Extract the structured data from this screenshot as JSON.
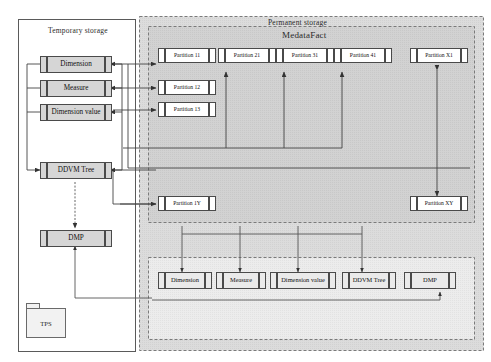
{
  "diagram": {
    "title_note": "",
    "regions": {
      "temporary_storage": "Temporary storage",
      "permanent_storage": "Permanent storage",
      "metadata_fact": "MedataFact"
    },
    "temporary_entities": [
      {
        "id": "tmp-dimension",
        "label": "Dimension"
      },
      {
        "id": "tmp-measure",
        "label": "Measure"
      },
      {
        "id": "tmp-dimension-value",
        "label": "Dimension value"
      },
      {
        "id": "tmp-ddvm-tree",
        "label": "DDVM Tree"
      },
      {
        "id": "tmp-dmp",
        "label": "DMP"
      }
    ],
    "source": {
      "id": "tps",
      "label": "TPS"
    },
    "partitions_top": [
      {
        "id": "partition-11",
        "label": "Partition 11"
      },
      {
        "id": "partition-21",
        "label": "Partition 21"
      },
      {
        "id": "partition-31",
        "label": "Partition 31"
      },
      {
        "id": "partition-41",
        "label": "Partition 41"
      },
      {
        "id": "partition-x1",
        "label": "Partition X1"
      }
    ],
    "partitions_left_stack": [
      {
        "id": "partition-12",
        "label": "Partition 12"
      },
      {
        "id": "partition-13",
        "label": "Partition 13"
      }
    ],
    "partitions_bottom": [
      {
        "id": "partition-1y",
        "label": "Partition 1Y"
      },
      {
        "id": "partition-xy",
        "label": "Partition XY"
      }
    ],
    "permanent_entities": [
      {
        "id": "perm-dimension",
        "label": "Dimension"
      },
      {
        "id": "perm-measure",
        "label": "Measure"
      },
      {
        "id": "perm-dimension-value",
        "label": "Dimension value"
      },
      {
        "id": "perm-ddvm-tree",
        "label": "DDVM Tree"
      },
      {
        "id": "perm-dmp",
        "label": "DMP"
      }
    ],
    "colors": {
      "line": "#4a4a4a",
      "box_border": "#4a4a4a",
      "shaded_fill": "#d6d6d6",
      "plain_fill": "#ffffff",
      "permanent_fill": "#dcdcdc",
      "metadata_fill": "#d0d0d0",
      "bottom_band_fill": "#e8e8e8"
    }
  }
}
